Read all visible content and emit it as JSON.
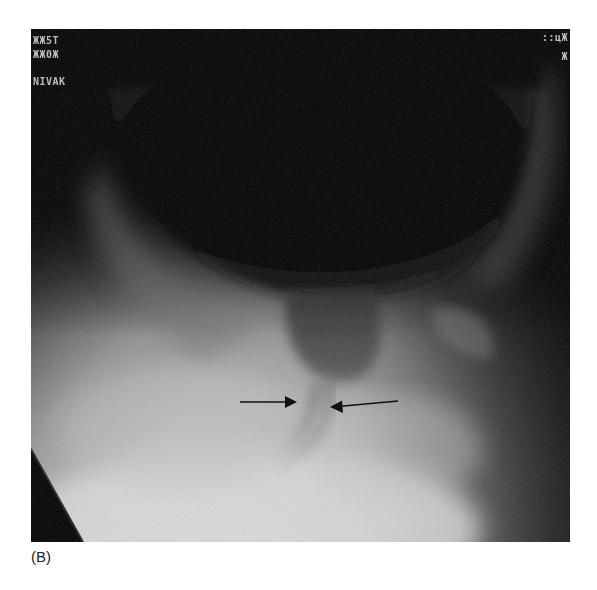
{
  "figure": {
    "panel_label": "(B)",
    "overlay_text": {
      "top_left_line1": "ЖЖ5Т",
      "top_left_line2": "ЖЖ0Ж",
      "top_left_line3": "ΝΙVΑΚ",
      "top_right_line1": "::цЖ",
      "top_right_line2": "Ж"
    },
    "annotations": [
      {
        "type": "arrow",
        "direction": "right",
        "x1": 209,
        "y1": 373,
        "x2": 266,
        "y2": 373
      },
      {
        "type": "arrow",
        "direction": "left",
        "x1": 367,
        "y1": 372,
        "x2": 299,
        "y2": 378
      }
    ],
    "colors": {
      "background": "#ffffff",
      "arrow": "#111111",
      "contrast_dark": "#050505",
      "soft_tissue": "#9a9a9a",
      "bright_region": "#dedede"
    }
  }
}
